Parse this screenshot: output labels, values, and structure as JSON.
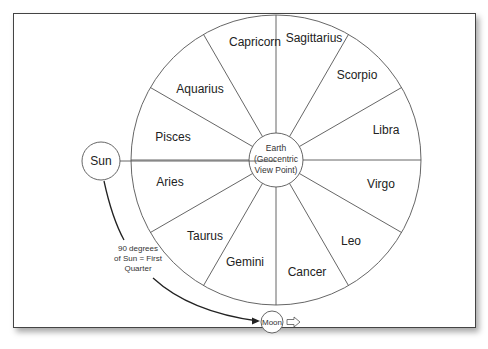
{
  "diagram": {
    "wheel": {
      "center_label": [
        "Earth",
        "(Geocentric",
        "View Point)"
      ],
      "signs": [
        {
          "name": "Sagittarius",
          "x": 312,
          "y": 44
        },
        {
          "name": "Scorpio",
          "x": 356,
          "y": 79
        },
        {
          "name": "Libra",
          "x": 386,
          "y": 134
        },
        {
          "name": "Virgo",
          "x": 381,
          "y": 188
        },
        {
          "name": "Leo",
          "x": 353,
          "y": 245
        },
        {
          "name": "Cancer",
          "x": 307,
          "y": 276
        },
        {
          "name": "Gemini",
          "x": 246,
          "y": 266
        },
        {
          "name": "Taurus",
          "x": 205,
          "y": 240
        },
        {
          "name": "Aries",
          "x": 171,
          "y": 186
        },
        {
          "name": "Pisces",
          "x": 173,
          "y": 140
        },
        {
          "name": "Aquarius",
          "x": 200,
          "y": 92
        },
        {
          "name": "Capricorn",
          "x": 254,
          "y": 45
        }
      ]
    },
    "sun": {
      "label": "Sun"
    },
    "moon": {
      "label": "Moon"
    },
    "annotation": [
      "90 degrees",
      "of Sun = First",
      "Quarter"
    ],
    "direction_arrow": "hollow-right-arrow"
  }
}
